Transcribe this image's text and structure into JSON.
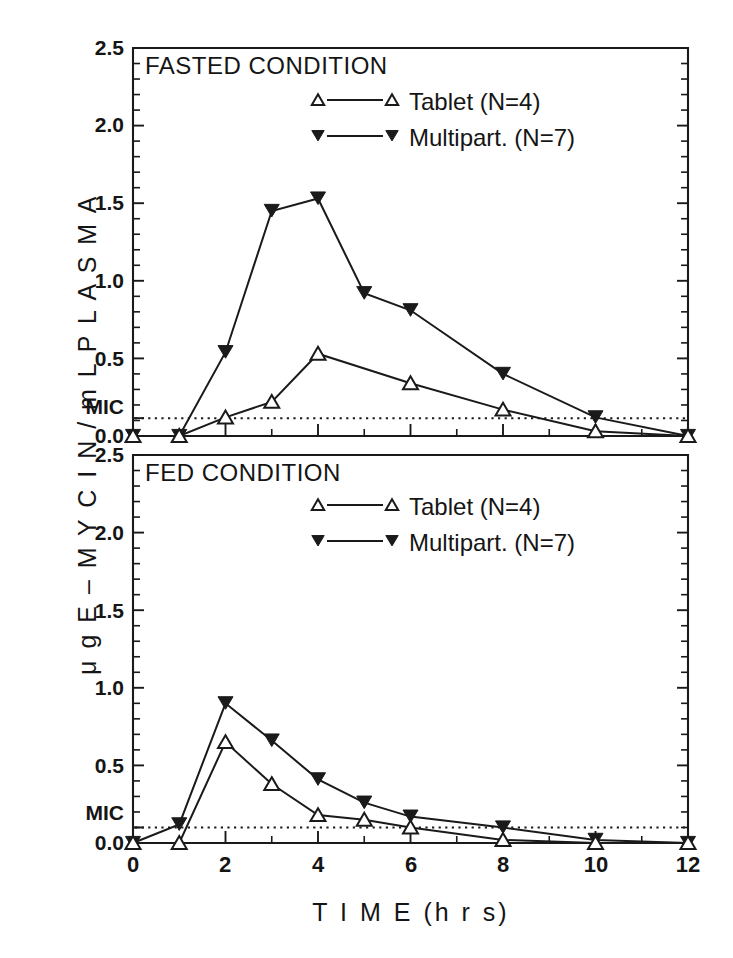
{
  "figure": {
    "y_axis_label": "μ g  E – M Y C I N / m L  P L A S M A",
    "x_axis_label": "T I M E   (h r s)",
    "mic_label": "MIC"
  },
  "panels": [
    {
      "id": "fasted",
      "title": "FASTED CONDITION",
      "legend": [
        {
          "marker": "open-triangle-up",
          "label": "Tablet (N=4)"
        },
        {
          "marker": "filled-triangle-down",
          "label": "Multipart. (N=7)"
        }
      ],
      "y_ticks": [
        "0.0",
        "0.5",
        "1.0",
        "1.5",
        "2.0",
        "2.5"
      ],
      "mic_tick": "MIC"
    },
    {
      "id": "fed",
      "title": "FED CONDITION",
      "legend": [
        {
          "marker": "open-triangle-up",
          "label": "Tablet (N=4)"
        },
        {
          "marker": "filled-triangle-down",
          "label": "Multipart. (N=7)"
        }
      ],
      "y_ticks": [
        "0.0",
        "0.5",
        "1.0",
        "1.5",
        "2.0",
        "2.5"
      ],
      "mic_tick": "MIC"
    }
  ],
  "x_ticks": [
    "0",
    "2",
    "4",
    "6",
    "8",
    "10",
    "12"
  ],
  "chart_data": [
    {
      "type": "line",
      "panel": "fasted",
      "title": "FASTED CONDITION",
      "xlabel": "T I M E (h r s)",
      "ylabel": "μg E-MYCIN / mL PLASMA",
      "xlim": [
        0,
        12
      ],
      "ylim": [
        0,
        2.5
      ],
      "xticks": [
        0,
        2,
        4,
        6,
        8,
        10,
        12
      ],
      "yticks": [
        0.0,
        0.5,
        1.0,
        1.5,
        2.0,
        2.5
      ],
      "grid": false,
      "legend_position": "top-right",
      "annotations": [
        {
          "text": "MIC",
          "type": "hline",
          "y": 0.12
        }
      ],
      "x": [
        0,
        1,
        2,
        3,
        4,
        6,
        8,
        10,
        12
      ],
      "series": [
        {
          "name": "Tablet (N=4)",
          "marker": "open-triangle-up",
          "values": [
            0.0,
            0.0,
            0.12,
            0.22,
            0.53,
            0.34,
            0.17,
            0.03,
            0.0
          ]
        },
        {
          "name": "Multipart. (N=7)",
          "marker": "filled-triangle-down",
          "values": [
            0.0,
            0.0,
            0.54,
            1.45,
            1.53,
            0.92,
            0.81,
            0.4,
            0.12,
            0.0
          ]
        }
      ],
      "series_x": [
        {
          "name": "Tablet (N=4)",
          "x": [
            0,
            1,
            2,
            3,
            4,
            6,
            8,
            10,
            12
          ]
        },
        {
          "name": "Multipart. (N=7)",
          "x": [
            0,
            1,
            2,
            3,
            4,
            5,
            6,
            8,
            10,
            12
          ]
        }
      ]
    },
    {
      "type": "line",
      "panel": "fed",
      "title": "FED CONDITION",
      "xlabel": "T I M E (h r s)",
      "ylabel": "μg E-MYCIN / mL PLASMA",
      "xlim": [
        0,
        12
      ],
      "ylim": [
        0,
        2.5
      ],
      "xticks": [
        0,
        2,
        4,
        6,
        8,
        10,
        12
      ],
      "yticks": [
        0.0,
        0.5,
        1.0,
        1.5,
        2.0,
        2.5
      ],
      "grid": false,
      "legend_position": "top-right",
      "annotations": [
        {
          "text": "MIC",
          "type": "hline",
          "y": 0.1
        }
      ],
      "x": [
        0,
        1,
        2,
        3,
        4,
        5,
        6,
        8,
        10,
        12
      ],
      "series": [
        {
          "name": "Tablet (N=4)",
          "marker": "open-triangle-up",
          "values": [
            0.0,
            0.0,
            0.65,
            0.38,
            0.18,
            0.15,
            0.1,
            0.02,
            0.0,
            0.0
          ]
        },
        {
          "name": "Multipart. (N=7)",
          "marker": "filled-triangle-down",
          "values": [
            0.0,
            0.12,
            0.9,
            0.66,
            0.41,
            0.26,
            0.17,
            0.1,
            0.02,
            0.0
          ]
        }
      ]
    }
  ]
}
